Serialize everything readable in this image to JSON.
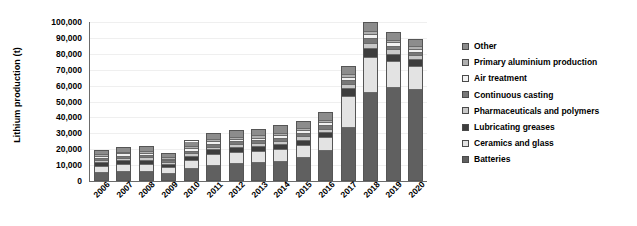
{
  "chart_data": {
    "type": "bar",
    "subtype": "stacked-vertical",
    "title": "",
    "xlabel": "",
    "ylabel": "Lithium production (t)",
    "ylim": [
      0,
      100000
    ],
    "ytick_labels": [
      "100,000",
      "90,000",
      "80,000",
      "70,000",
      "60,000",
      "50,000",
      "40,000",
      "30,000",
      "20,000",
      "10,000",
      "0"
    ],
    "ytick_values": [
      100000,
      90000,
      80000,
      70000,
      60000,
      50000,
      40000,
      30000,
      20000,
      10000,
      0
    ],
    "grid": true,
    "legend_position": "right",
    "categories": [
      "2006",
      "2007",
      "2008",
      "2009",
      "2010",
      "2011",
      "2012",
      "2013",
      "2014",
      "2015",
      "2016",
      "2017",
      "2018",
      "2019",
      "2020"
    ],
    "series": [
      {
        "name": "Batteries",
        "color": "#606060",
        "values": [
          4500,
          5200,
          5400,
          4200,
          7200,
          9500,
          10500,
          11000,
          12000,
          14500,
          18500,
          33500,
          55500,
          58500,
          57500
        ]
      },
      {
        "name": "Ceramics and glass",
        "color": "#e3e3e3",
        "values": [
          4200,
          4600,
          4700,
          3800,
          5200,
          6800,
          7000,
          7200,
          7500,
          7800,
          8500,
          19500,
          22500,
          16500,
          14500
        ]
      },
      {
        "name": "Lubricating greases",
        "color": "#3d3d3d",
        "values": [
          2600,
          2800,
          2800,
          2200,
          2900,
          3100,
          3200,
          3200,
          3300,
          3400,
          3500,
          5000,
          5500,
          5000,
          4500
        ]
      },
      {
        "name": "Pharmaceuticals and polymers",
        "color": "#c8c8c8",
        "values": [
          1500,
          1600,
          1600,
          1300,
          1800,
          1900,
          2000,
          2000,
          2100,
          2100,
          2200,
          2800,
          3200,
          2600,
          2400
        ]
      },
      {
        "name": "Continuous casting",
        "color": "#787878",
        "values": [
          1400,
          1500,
          1500,
          1200,
          1700,
          1800,
          1900,
          1900,
          2000,
          2000,
          2100,
          2600,
          3000,
          2400,
          2200
        ]
      },
      {
        "name": "Air treatment",
        "color": "#f2f2f2",
        "values": [
          1300,
          1400,
          1400,
          1100,
          1500,
          1600,
          1700,
          1700,
          1800,
          1800,
          1900,
          2200,
          2600,
          2100,
          1900
        ]
      },
      {
        "name": "Primary aluminium production",
        "color": "#b0b0b0",
        "values": [
          1200,
          1300,
          1300,
          1000,
          1400,
          1500,
          1500,
          1500,
          1600,
          1600,
          1700,
          1900,
          2200,
          1800,
          1600
        ]
      },
      {
        "name": "Other",
        "color": "#8c8c8c",
        "values": [
          2800,
          3100,
          3300,
          2700,
          3800,
          4200,
          4500,
          4500,
          4700,
          4800,
          5100,
          5000,
          5500,
          5100,
          4900
        ]
      }
    ],
    "legend_entries": [
      {
        "label": "Other",
        "color": "#8c8c8c"
      },
      {
        "label": "Primary aluminium production",
        "color": "#b0b0b0"
      },
      {
        "label": "Air treatment",
        "color": "#f2f2f2"
      },
      {
        "label": "Continuous casting",
        "color": "#787878"
      },
      {
        "label": "Pharmaceuticals and polymers",
        "color": "#c8c8c8"
      },
      {
        "label": "Lubricating greases",
        "color": "#3d3d3d"
      },
      {
        "label": "Ceramics and glass",
        "color": "#e3e3e3"
      },
      {
        "label": "Batteries",
        "color": "#606060"
      }
    ],
    "totals": [
      19500,
      21500,
      22000,
      17500,
      25500,
      30400,
      32300,
      33000,
      35000,
      38000,
      43500,
      72500,
      100000,
      94000,
      89500
    ]
  },
  "colors": {
    "axis": "#6b6b6b",
    "gridline": "#efefef",
    "background": "#ffffff",
    "text": "#000000"
  }
}
